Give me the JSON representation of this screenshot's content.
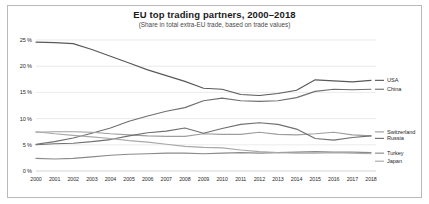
{
  "chart_data": {
    "type": "line",
    "title": "EU top trading partners, 2000–2018",
    "subtitle": "(Share in total extra-EU trade, based on trade values)",
    "xlabel": "",
    "ylabel": "",
    "xlim": [
      2000,
      2018
    ],
    "ylim": [
      0,
      25
    ],
    "grid": true,
    "legend_position": "right",
    "yticks": [
      0,
      5,
      10,
      15,
      20,
      25
    ],
    "ytick_labels": [
      "0 %",
      "5 %",
      "10 %",
      "15 %",
      "20 %",
      "25 %"
    ],
    "x": [
      2000,
      2001,
      2002,
      2003,
      2004,
      2005,
      2006,
      2007,
      2008,
      2009,
      2010,
      2011,
      2012,
      2013,
      2014,
      2015,
      2016,
      2017,
      2018
    ],
    "xtick_labels": [
      "2000",
      "2001",
      "2002",
      "2003",
      "2004",
      "2005",
      "2006",
      "2007",
      "2008",
      "2009",
      "2010",
      "2011",
      "2012",
      "2013",
      "2014",
      "2015",
      "2016",
      "2017",
      "2018"
    ],
    "series": [
      {
        "name": "USA",
        "color": "#595959",
        "values": [
          24.6,
          24.5,
          24.3,
          23.2,
          21.9,
          20.6,
          19.3,
          18.2,
          17.1,
          15.8,
          15.6,
          14.6,
          14.4,
          14.8,
          15.4,
          17.4,
          17.2,
          17.0,
          17.3
        ]
      },
      {
        "name": "China",
        "color": "#6f6f6f",
        "values": [
          5.1,
          5.6,
          6.3,
          7.2,
          8.2,
          9.5,
          10.5,
          11.4,
          12.1,
          13.4,
          13.9,
          13.4,
          13.3,
          13.4,
          14.0,
          15.2,
          15.6,
          15.5,
          15.6
        ]
      },
      {
        "name": "Switzerland",
        "color": "#9e9e9e",
        "values": [
          7.4,
          7.5,
          7.5,
          7.4,
          7.1,
          6.9,
          6.7,
          6.6,
          6.6,
          7.1,
          7.0,
          7.0,
          7.4,
          7.0,
          6.9,
          7.1,
          7.4,
          6.9,
          6.7
        ]
      },
      {
        "name": "Russia",
        "color": "#707070",
        "values": [
          5.0,
          5.2,
          5.3,
          5.6,
          6.0,
          6.7,
          7.3,
          7.6,
          8.2,
          7.2,
          8.1,
          8.9,
          9.2,
          8.9,
          8.0,
          6.2,
          5.9,
          6.4,
          6.7
        ]
      },
      {
        "name": "Turkey",
        "color": "#8a8a8a",
        "values": [
          2.4,
          2.3,
          2.4,
          2.7,
          3.0,
          3.2,
          3.3,
          3.4,
          3.4,
          3.3,
          3.4,
          3.5,
          3.4,
          3.5,
          3.6,
          3.7,
          3.6,
          3.6,
          3.5
        ]
      },
      {
        "name": "Japan",
        "color": "#a8a8a8",
        "values": [
          7.5,
          7.1,
          6.8,
          6.5,
          6.2,
          5.8,
          5.5,
          5.1,
          4.7,
          4.5,
          4.4,
          4.0,
          3.7,
          3.5,
          3.4,
          3.4,
          3.5,
          3.4,
          3.3
        ]
      }
    ]
  },
  "axes": {
    "ytick_labels": [
      "25 %",
      "20 %",
      "15 %",
      "10 %",
      "5 %",
      "0 %"
    ]
  },
  "legend": {
    "items": [
      {
        "label": "USA"
      },
      {
        "label": "China"
      },
      {
        "label": "Switzerland"
      },
      {
        "label": "Russia"
      },
      {
        "label": "Turkey"
      },
      {
        "label": "Japan"
      }
    ]
  }
}
